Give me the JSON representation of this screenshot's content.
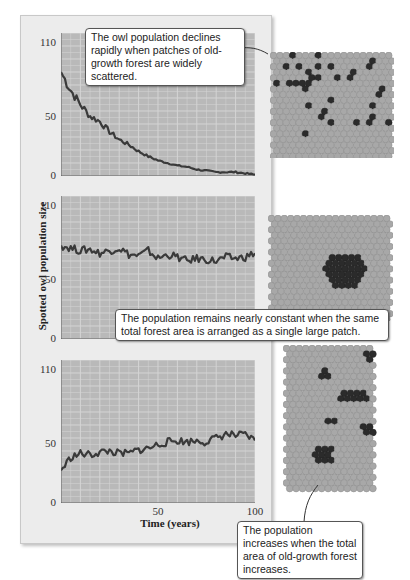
{
  "figure": {
    "ylabel": "Spotted owl population size",
    "xlabel": "Time (years)",
    "x_ticks": [
      "50",
      "100"
    ],
    "y_ticks": [
      "110",
      "50",
      "0"
    ]
  },
  "callouts": {
    "scattered": "The owl population declines rapidly when patches of old-growth forest are widely scattered.",
    "single_patch": "The population remains nearly constant when the same total forest area is arranged as a single large patch.",
    "increase": "The population increases when the total area of old-growth forest increases."
  },
  "colors": {
    "plot_bg": "#b9b9b9",
    "panel_bg": "#ececec",
    "line": "#3a3a3a",
    "hex_empty": "#a8a8a8",
    "hex_forest": "#2b2b2b"
  },
  "chart_data": [
    {
      "type": "line",
      "title": "Scattered old-growth patches",
      "xlabel": "Time (years)",
      "ylabel": "Spotted owl population size",
      "xlim": [
        0,
        100
      ],
      "ylim": [
        0,
        110
      ],
      "grid": true,
      "x": [
        0,
        5,
        10,
        15,
        20,
        25,
        30,
        35,
        40,
        45,
        50,
        55,
        60,
        65,
        70,
        75,
        80,
        85,
        90,
        95,
        100
      ],
      "series": [
        {
          "name": "Population",
          "values": [
            80,
            66,
            55,
            46,
            42,
            34,
            28,
            24,
            19,
            15,
            12,
            10,
            8,
            7,
            5,
            4,
            3,
            3,
            3,
            2,
            1
          ]
        }
      ]
    },
    {
      "type": "line",
      "title": "Single large patch",
      "xlabel": "Time (years)",
      "ylabel": "Spotted owl population size",
      "xlim": [
        0,
        100
      ],
      "ylim": [
        0,
        110
      ],
      "grid": true,
      "x": [
        0,
        5,
        10,
        15,
        20,
        25,
        30,
        35,
        40,
        45,
        50,
        55,
        60,
        65,
        70,
        75,
        80,
        85,
        90,
        95,
        100
      ],
      "series": [
        {
          "name": "Population",
          "values": [
            72,
            70,
            68,
            69,
            66,
            68,
            70,
            65,
            64,
            68,
            62,
            65,
            63,
            60,
            62,
            61,
            60,
            63,
            62,
            63,
            66
          ]
        }
      ]
    },
    {
      "type": "line",
      "title": "Increased total old-growth area",
      "xlabel": "Time (years)",
      "ylabel": "Spotted owl population size",
      "xlim": [
        0,
        100
      ],
      "ylim": [
        0,
        110
      ],
      "grid": true,
      "x": [
        0,
        5,
        10,
        15,
        20,
        25,
        30,
        35,
        40,
        45,
        50,
        55,
        60,
        65,
        70,
        75,
        80,
        85,
        90,
        95,
        100
      ],
      "series": [
        {
          "name": "Population",
          "values": [
            25,
            35,
            38,
            37,
            39,
            40,
            38,
            38,
            41,
            42,
            45,
            47,
            48,
            47,
            48,
            47,
            50,
            53,
            52,
            52,
            48
          ]
        }
      ]
    }
  ]
}
